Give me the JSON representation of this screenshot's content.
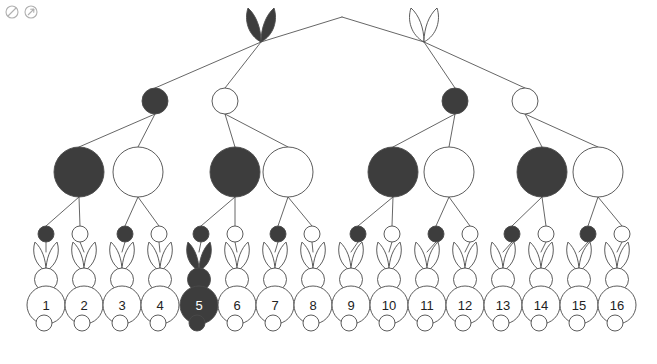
{
  "canvas": {
    "width": 657,
    "height": 364,
    "background": "#ffffff"
  },
  "palette": {
    "dark_fill": "#3d3d3d",
    "light_fill": "#ffffff",
    "stroke": "#4a4a4a",
    "edge": "#555555",
    "dark_label": "#ffffff",
    "light_label": "#222222",
    "corner_icon": "#b0b0b0"
  },
  "corner_icons": [
    {
      "name": "circle-slash-icon",
      "glyph": "circle-slash"
    },
    {
      "name": "circle-arrow-icon",
      "glyph": "circle-arrow"
    }
  ],
  "diagram": {
    "levels": [
      {
        "level": 1,
        "node_shape": "ear-pair",
        "y": 40,
        "nodes": [
          {
            "id": "L1-A",
            "x": 261,
            "fill": "dark",
            "label": ""
          },
          {
            "id": "L1-B",
            "x": 424,
            "fill": "light",
            "label": ""
          }
        ]
      },
      {
        "level": 2,
        "node_shape": "circle",
        "y": 101,
        "radius": 13,
        "nodes": [
          {
            "id": "L2-A",
            "x": 155,
            "fill": "dark",
            "label": ""
          },
          {
            "id": "L2-B",
            "x": 225,
            "fill": "light",
            "label": ""
          },
          {
            "id": "L2-C",
            "x": 455,
            "fill": "dark",
            "label": ""
          },
          {
            "id": "L2-D",
            "x": 525,
            "fill": "light",
            "label": ""
          }
        ]
      },
      {
        "level": 3,
        "node_shape": "circle",
        "y": 172,
        "radius": 25,
        "nodes": [
          {
            "id": "L3-A",
            "x": 79,
            "fill": "dark",
            "label": ""
          },
          {
            "id": "L3-B",
            "x": 138,
            "fill": "light",
            "label": ""
          },
          {
            "id": "L3-C",
            "x": 235,
            "fill": "dark",
            "label": ""
          },
          {
            "id": "L3-D",
            "x": 288,
            "fill": "light",
            "label": ""
          },
          {
            "id": "L3-E",
            "x": 393,
            "fill": "dark",
            "label": ""
          },
          {
            "id": "L3-F",
            "x": 449,
            "fill": "light",
            "label": ""
          },
          {
            "id": "L3-G",
            "x": 542,
            "fill": "dark",
            "label": ""
          },
          {
            "id": "L3-H",
            "x": 598,
            "fill": "light",
            "label": ""
          }
        ]
      },
      {
        "level": 4,
        "node_shape": "circle",
        "y": 234,
        "radius": 8,
        "nodes": [
          {
            "id": "L4-01",
            "x": 46,
            "fill": "dark",
            "label": ""
          },
          {
            "id": "L4-02",
            "x": 80,
            "fill": "light",
            "label": ""
          },
          {
            "id": "L4-03",
            "x": 125,
            "fill": "dark",
            "label": ""
          },
          {
            "id": "L4-04",
            "x": 159,
            "fill": "light",
            "label": ""
          },
          {
            "id": "L4-05",
            "x": 201,
            "fill": "dark",
            "label": ""
          },
          {
            "id": "L4-06",
            "x": 235,
            "fill": "light",
            "label": ""
          },
          {
            "id": "L4-07",
            "x": 278,
            "fill": "dark",
            "label": ""
          },
          {
            "id": "L4-08",
            "x": 312,
            "fill": "light",
            "label": ""
          },
          {
            "id": "L4-09",
            "x": 358,
            "fill": "dark",
            "label": ""
          },
          {
            "id": "L4-10",
            "x": 392,
            "fill": "light",
            "label": ""
          },
          {
            "id": "L4-11",
            "x": 436,
            "fill": "dark",
            "label": ""
          },
          {
            "id": "L4-12",
            "x": 470,
            "fill": "light",
            "label": ""
          },
          {
            "id": "L4-13",
            "x": 512,
            "fill": "dark",
            "label": ""
          },
          {
            "id": "L4-14",
            "x": 546,
            "fill": "light",
            "label": ""
          },
          {
            "id": "L4-15",
            "x": 588,
            "fill": "dark",
            "label": ""
          },
          {
            "id": "L4-16",
            "x": 622,
            "fill": "light",
            "label": ""
          }
        ]
      },
      {
        "level": 5,
        "node_shape": "rabbit",
        "y": 305,
        "radius": 19,
        "nodes": [
          {
            "id": "R1",
            "x": 46,
            "fill": "light",
            "label": "1"
          },
          {
            "id": "R2",
            "x": 84,
            "fill": "light",
            "label": "2"
          },
          {
            "id": "R3",
            "x": 122,
            "fill": "light",
            "label": "3"
          },
          {
            "id": "R4",
            "x": 160,
            "fill": "light",
            "label": "4"
          },
          {
            "id": "R5",
            "x": 199,
            "fill": "dark",
            "label": "5"
          },
          {
            "id": "R6",
            "x": 237,
            "fill": "light",
            "label": "6"
          },
          {
            "id": "R7",
            "x": 275,
            "fill": "light",
            "label": "7"
          },
          {
            "id": "R8",
            "x": 313,
            "fill": "light",
            "label": "8"
          },
          {
            "id": "R9",
            "x": 351,
            "fill": "light",
            "label": "9"
          },
          {
            "id": "R10",
            "x": 389,
            "fill": "light",
            "label": "10"
          },
          {
            "id": "R11",
            "x": 427,
            "fill": "light",
            "label": "11"
          },
          {
            "id": "R12",
            "x": 465,
            "fill": "light",
            "label": "12"
          },
          {
            "id": "R13",
            "x": 503,
            "fill": "light",
            "label": "13"
          },
          {
            "id": "R14",
            "x": 541,
            "fill": "light",
            "label": "14"
          },
          {
            "id": "R15",
            "x": 579,
            "fill": "light",
            "label": "15"
          },
          {
            "id": "R16",
            "x": 617,
            "fill": "light",
            "label": "16"
          }
        ]
      }
    ],
    "root_apex": {
      "x": 342,
      "y": 17
    },
    "edges": [
      {
        "from": "root",
        "to": "L1-A"
      },
      {
        "from": "root",
        "to": "L1-B"
      },
      {
        "from": "L1-A",
        "to": "L2-A"
      },
      {
        "from": "L1-A",
        "to": "L2-B"
      },
      {
        "from": "L1-B",
        "to": "L2-C"
      },
      {
        "from": "L1-B",
        "to": "L2-D"
      },
      {
        "from": "L2-A",
        "to": "L3-A"
      },
      {
        "from": "L2-A",
        "to": "L3-B"
      },
      {
        "from": "L2-B",
        "to": "L3-C"
      },
      {
        "from": "L2-B",
        "to": "L3-D"
      },
      {
        "from": "L2-C",
        "to": "L3-E"
      },
      {
        "from": "L2-C",
        "to": "L3-F"
      },
      {
        "from": "L2-D",
        "to": "L3-G"
      },
      {
        "from": "L2-D",
        "to": "L3-H"
      },
      {
        "from": "L3-A",
        "to": "L4-01"
      },
      {
        "from": "L3-A",
        "to": "L4-02"
      },
      {
        "from": "L3-B",
        "to": "L4-03"
      },
      {
        "from": "L3-B",
        "to": "L4-04"
      },
      {
        "from": "L3-C",
        "to": "L4-05"
      },
      {
        "from": "L3-C",
        "to": "L4-06"
      },
      {
        "from": "L3-D",
        "to": "L4-07"
      },
      {
        "from": "L3-D",
        "to": "L4-08"
      },
      {
        "from": "L3-E",
        "to": "L4-09"
      },
      {
        "from": "L3-E",
        "to": "L4-10"
      },
      {
        "from": "L3-F",
        "to": "L4-11"
      },
      {
        "from": "L3-F",
        "to": "L4-12"
      },
      {
        "from": "L3-G",
        "to": "L4-13"
      },
      {
        "from": "L3-G",
        "to": "L4-14"
      },
      {
        "from": "L3-H",
        "to": "L4-15"
      },
      {
        "from": "L3-H",
        "to": "L4-16"
      },
      {
        "from": "L4-01",
        "to": "R1"
      },
      {
        "from": "L4-02",
        "to": "R2"
      },
      {
        "from": "L4-03",
        "to": "R3"
      },
      {
        "from": "L4-04",
        "to": "R4"
      },
      {
        "from": "L4-05",
        "to": "R5"
      },
      {
        "from": "L4-06",
        "to": "R6"
      },
      {
        "from": "L4-07",
        "to": "R7"
      },
      {
        "from": "L4-08",
        "to": "R8"
      },
      {
        "from": "L4-09",
        "to": "R9"
      },
      {
        "from": "L4-10",
        "to": "R10"
      },
      {
        "from": "L4-11",
        "to": "R11"
      },
      {
        "from": "L4-12",
        "to": "R12"
      },
      {
        "from": "L4-13",
        "to": "R13"
      },
      {
        "from": "L4-14",
        "to": "R14"
      },
      {
        "from": "L4-15",
        "to": "R15"
      },
      {
        "from": "L4-16",
        "to": "R16"
      }
    ]
  }
}
